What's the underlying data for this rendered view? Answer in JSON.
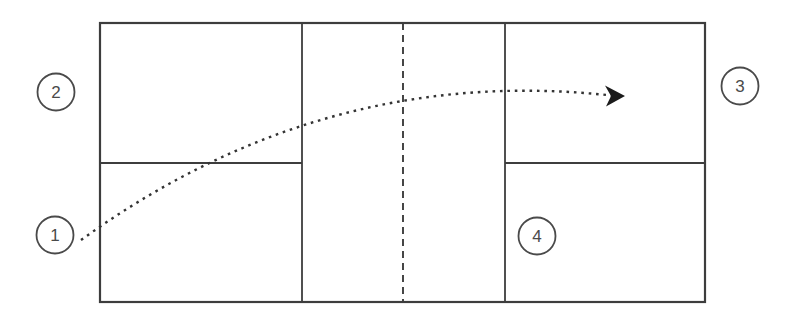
{
  "diagram": {
    "markers": [
      {
        "label": "1"
      },
      {
        "label": "2"
      },
      {
        "label": "3"
      },
      {
        "label": "4"
      }
    ],
    "colors": {
      "line": "#3d3d3d",
      "trajectory": "#343434",
      "arrowhead": "#1b1b1b",
      "label_text": "#4a4a4a",
      "background": "#ffffff"
    }
  }
}
